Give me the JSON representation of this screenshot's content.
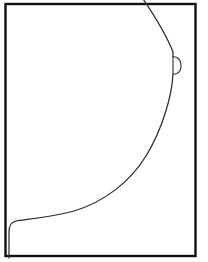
{
  "figure": {
    "kind": "line-drawing",
    "subject_label": "breast-profile-contour",
    "canvas": {
      "width": 208,
      "height": 262
    },
    "background_color": "#ffffff"
  },
  "frame": {
    "label": "image-border",
    "stroke_color": "#111111",
    "stroke_width": 2.4,
    "x": 5.5,
    "y": 4.0,
    "width": 190,
    "height": 252
  },
  "contour": {
    "label": "breast-outline",
    "stroke_color": "#2b2b2b",
    "stroke_width": 1.25,
    "path": "M 141 -4 C 152 12, 166 34, 173 52 L 173 57 M 173 74 C 172 96, 162 130, 146 156 C 130 182, 104 202, 74 211 C 52 217, 30 219, 16 221 C 11 222, 9 226, 9 232 L 9 258"
  },
  "nipple": {
    "label": "nipple-detail",
    "stroke_color": "#3a3a3a",
    "fill_color": "#fbfbfb",
    "stroke_width": 1.15,
    "path": "M 173 56.5 L 177 57.5 C 180 59.5, 181 64, 181 66 C 181 69, 180 72, 177 73.5 L 173 74.5 Z"
  },
  "annotations": {
    "caption": "",
    "labels": []
  }
}
